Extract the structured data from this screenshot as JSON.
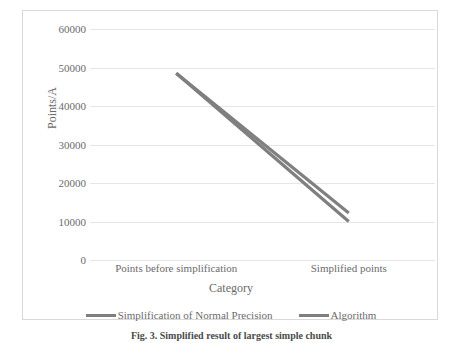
{
  "chart_data": {
    "type": "line",
    "title": "",
    "xlabel": "Category",
    "ylabel": "Points/A",
    "categories": [
      "Points before simplification",
      "Simplified points"
    ],
    "ylim": [
      0,
      60000
    ],
    "yticks": [
      0,
      10000,
      20000,
      30000,
      40000,
      50000,
      60000
    ],
    "ytick_labels": [
      "0",
      "10000",
      "20000",
      "30000",
      "40000",
      "50000",
      "60000"
    ],
    "grid": "horizontal",
    "legend_position": "bottom",
    "series": [
      {
        "name": "Simplification of Normal Precision",
        "values": [
          48500,
          10000
        ],
        "color": "#7f7f7f"
      },
      {
        "name": "Algorithm",
        "values": [
          48500,
          12200
        ],
        "color": "#808080"
      }
    ]
  },
  "caption": {
    "label": "Fig. 3.",
    "text": "Simplified result of largest simple chunk"
  },
  "colors": {
    "series_gray": "#7f7f7f",
    "gridline": "#e6e6e6",
    "border": "#d9d9d9",
    "text": "#6b6b6b"
  }
}
